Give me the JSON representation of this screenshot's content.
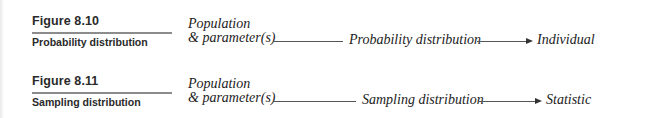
{
  "figures": [
    {
      "label": "Figure 8.10",
      "caption": "Probability distribution",
      "diagram": {
        "source_line1": "Population",
        "source_line2": "& parameter(s)",
        "middle": "Probability distribution",
        "target": "Individual"
      }
    },
    {
      "label": "Figure 8.11",
      "caption": "Sampling distribution",
      "diagram": {
        "source_line1": "Population",
        "source_line2": "& parameter(s)",
        "middle": "Sampling distribution",
        "target": "Statistic"
      }
    }
  ]
}
